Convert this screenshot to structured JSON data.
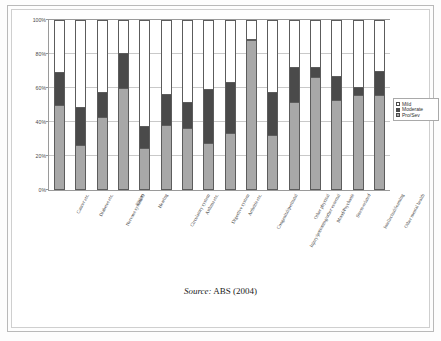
{
  "figure": {
    "source_label": "Source:",
    "source_text": "ABS (2004)"
  },
  "legend": {
    "position": "right",
    "items": [
      {
        "label": "Mild",
        "color": "#ffffff"
      },
      {
        "label": "Moderate",
        "color": "#4a4a4a"
      },
      {
        "label": "Pro/Sev",
        "color": "#a8a8a8"
      }
    ]
  },
  "chart_data": {
    "type": "bar",
    "subtype": "stacked-100-percent",
    "title": "",
    "subtitle": "",
    "xlabel": "",
    "ylabel": "",
    "ylim": [
      0,
      100
    ],
    "ytick_labels": [
      "0%",
      "20%",
      "40%",
      "60%",
      "80%",
      "100%"
    ],
    "ytick_values": [
      0,
      20,
      40,
      60,
      80,
      100
    ],
    "grid": true,
    "grid_axis": "y",
    "legend_position": "right",
    "categories": [
      "Cancer etc.",
      "Diabetes etc.",
      "Nervous system/O",
      "Vision",
      "Hearing",
      "Circulatory system",
      "Asthma etc.",
      "Digestive system",
      "Arthritis etc.",
      "Congenital/perinatal",
      "Injury/poisoning/other external",
      "Other physical",
      "Mood/Psychosis",
      "Stress-related",
      "Intellectual/learning",
      "Other mental health"
    ],
    "series": [
      {
        "name": "Pro/Sev",
        "color": "#a8a8a8",
        "values": [
          50,
          26,
          43,
          60,
          24,
          38,
          36,
          27,
          33,
          89,
          32,
          52,
          67,
          53,
          56,
          56
        ]
      },
      {
        "name": "Moderate",
        "color": "#4a4a4a",
        "values": [
          19,
          22,
          14,
          21,
          13,
          18,
          15,
          32,
          30,
          0,
          25,
          20,
          5,
          14,
          4,
          14
        ]
      },
      {
        "name": "Mild",
        "color": "#ffffff",
        "values": [
          31,
          52,
          43,
          19,
          63,
          44,
          49,
          41,
          37,
          11,
          43,
          28,
          28,
          33,
          40,
          30
        ]
      }
    ],
    "stack_totals": [
      {
        "category": "Cancer etc.",
        "prosev": 50,
        "moderate": 19,
        "cumulative_mod_top": 69
      },
      {
        "category": "Diabetes etc.",
        "prosev": 26,
        "moderate": 22,
        "cumulative_mod_top": 48
      },
      {
        "category": "Nervous system/O",
        "prosev": 43,
        "moderate": 14,
        "cumulative_mod_top": 57
      },
      {
        "category": "Vision",
        "prosev": 60,
        "moderate": 21,
        "cumulative_mod_top": 81
      },
      {
        "category": "Hearing",
        "prosev": 24,
        "moderate": 13,
        "cumulative_mod_top": 37
      },
      {
        "category": "Circulatory system",
        "prosev": 38,
        "moderate": 18,
        "cumulative_mod_top": 56
      },
      {
        "category": "Asthma etc.",
        "prosev": 36,
        "moderate": 15,
        "cumulative_mod_top": 51
      },
      {
        "category": "Digestive system",
        "prosev": 27,
        "moderate": 32,
        "cumulative_mod_top": 59
      },
      {
        "category": "Arthritis etc.",
        "prosev": 33,
        "moderate": 30,
        "cumulative_mod_top": 63
      },
      {
        "category": "Congenital/perinatal",
        "prosev": 89,
        "moderate": 0,
        "cumulative_mod_top": 89
      },
      {
        "category": "Injury/poisoning/other external",
        "prosev": 32,
        "moderate": 25,
        "cumulative_mod_top": 57
      },
      {
        "category": "Other physical",
        "prosev": 52,
        "moderate": 20,
        "cumulative_mod_top": 72
      },
      {
        "category": "Mood/Psychosis",
        "prosev": 67,
        "moderate": 5,
        "cumulative_mod_top": 72
      },
      {
        "category": "Stress-related",
        "prosev": 53,
        "moderate": 14,
        "cumulative_mod_top": 67
      },
      {
        "category": "Intellectual/learning",
        "prosev": 56,
        "moderate": 4,
        "cumulative_mod_top": 60
      },
      {
        "category": "Other mental health",
        "prosev": 56,
        "moderate": 14,
        "cumulative_mod_top": 70
      }
    ]
  }
}
